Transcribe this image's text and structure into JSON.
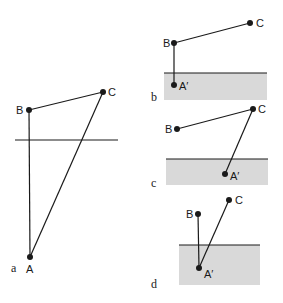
{
  "figure": {
    "panels": [
      {
        "id": "a",
        "label": "a",
        "points": {
          "A": "A",
          "B": "B",
          "C": "C"
        },
        "has_shaded_region": false
      },
      {
        "id": "b",
        "label": "b",
        "points": {
          "A": "A′",
          "B": "B",
          "C": "C"
        },
        "has_shaded_region": true
      },
      {
        "id": "c",
        "label": "c",
        "points": {
          "A": "A′",
          "B": "B",
          "C": "C"
        },
        "has_shaded_region": true
      },
      {
        "id": "d",
        "label": "d",
        "points": {
          "A": "A′",
          "B": "B",
          "C": "C"
        },
        "has_shaded_region": true
      }
    ],
    "colors": {
      "line": "#1a1a1a",
      "shade": "#d9d9d9"
    }
  }
}
